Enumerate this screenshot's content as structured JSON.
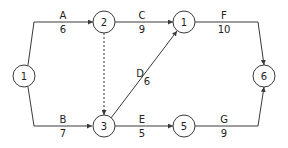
{
  "diagram": {
    "type": "activity-on-arrow network",
    "colors": {
      "line": "#3a3a3a",
      "text": "#222222",
      "background": "#ffffff"
    },
    "nodes": [
      {
        "id": "n1",
        "label": "1",
        "cx": 24,
        "cy": 76
      },
      {
        "id": "n2",
        "label": "2",
        "cx": 104,
        "cy": 22
      },
      {
        "id": "n4",
        "label": "1",
        "cx": 184,
        "cy": 22
      },
      {
        "id": "n3",
        "label": "3",
        "cx": 104,
        "cy": 126
      },
      {
        "id": "n5",
        "label": "5",
        "cx": 184,
        "cy": 126
      },
      {
        "id": "n6",
        "label": "6",
        "cx": 264,
        "cy": 76
      }
    ],
    "edges": [
      {
        "name": "A",
        "duration": "6",
        "from": "n1",
        "to": "n2"
      },
      {
        "name": "B",
        "duration": "7",
        "from": "n1",
        "to": "n3"
      },
      {
        "name": "C",
        "duration": "9",
        "from": "n2",
        "to": "n4"
      },
      {
        "name": "D",
        "duration": "6",
        "from": "n3",
        "to": "n4"
      },
      {
        "name": "E",
        "duration": "5",
        "from": "n3",
        "to": "n5"
      },
      {
        "name": "F",
        "duration": "10",
        "from": "n4",
        "to": "n6"
      },
      {
        "name": "G",
        "duration": "9",
        "from": "n5",
        "to": "n6"
      },
      {
        "name": "dummy",
        "duration": "",
        "from": "n2",
        "to": "n3",
        "style": "dashed"
      }
    ]
  }
}
